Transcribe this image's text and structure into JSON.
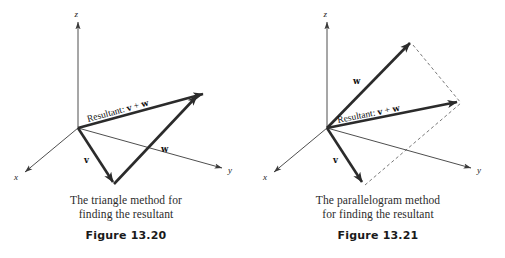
{
  "page": {
    "background_color": "#ffffff",
    "width": 505,
    "height": 258
  },
  "colors": {
    "axis_line": "#3a3a3a",
    "vector_line": "#2b2b2b",
    "dashed_line": "#555555",
    "text": "#1a1a1a",
    "caption_text": "#2b2b2b"
  },
  "figures": [
    {
      "id": "figure-13-20",
      "caption_line_1": "The triangle method for",
      "caption_line_2": "finding the resultant",
      "figure_number": "Figure 13.20",
      "axes": [
        {
          "name": "x-axis",
          "label": "x"
        },
        {
          "name": "y-axis",
          "label": "y"
        },
        {
          "name": "z-axis",
          "label": "z"
        }
      ],
      "vectors": [
        {
          "name": "vector-v",
          "label": "v"
        },
        {
          "name": "vector-w",
          "label": "w"
        },
        {
          "name": "vector-resultant",
          "label_prefix": "Resultant: ",
          "label_v": "v",
          "label_plus": " + ",
          "label_w": "w"
        }
      ]
    },
    {
      "id": "figure-13-21",
      "caption_line_1": "The parallelogram method",
      "caption_line_2": "for finding the resultant",
      "figure_number": "Figure 13.21",
      "axes": [
        {
          "name": "x-axis",
          "label": "x"
        },
        {
          "name": "y-axis",
          "label": "y"
        },
        {
          "name": "z-axis",
          "label": "z"
        }
      ],
      "vectors": [
        {
          "name": "vector-v",
          "label": "v"
        },
        {
          "name": "vector-w",
          "label": "w"
        },
        {
          "name": "vector-resultant",
          "label_prefix": "Resultant: ",
          "label_v": "v",
          "label_plus": " + ",
          "label_w": "w"
        }
      ]
    }
  ]
}
